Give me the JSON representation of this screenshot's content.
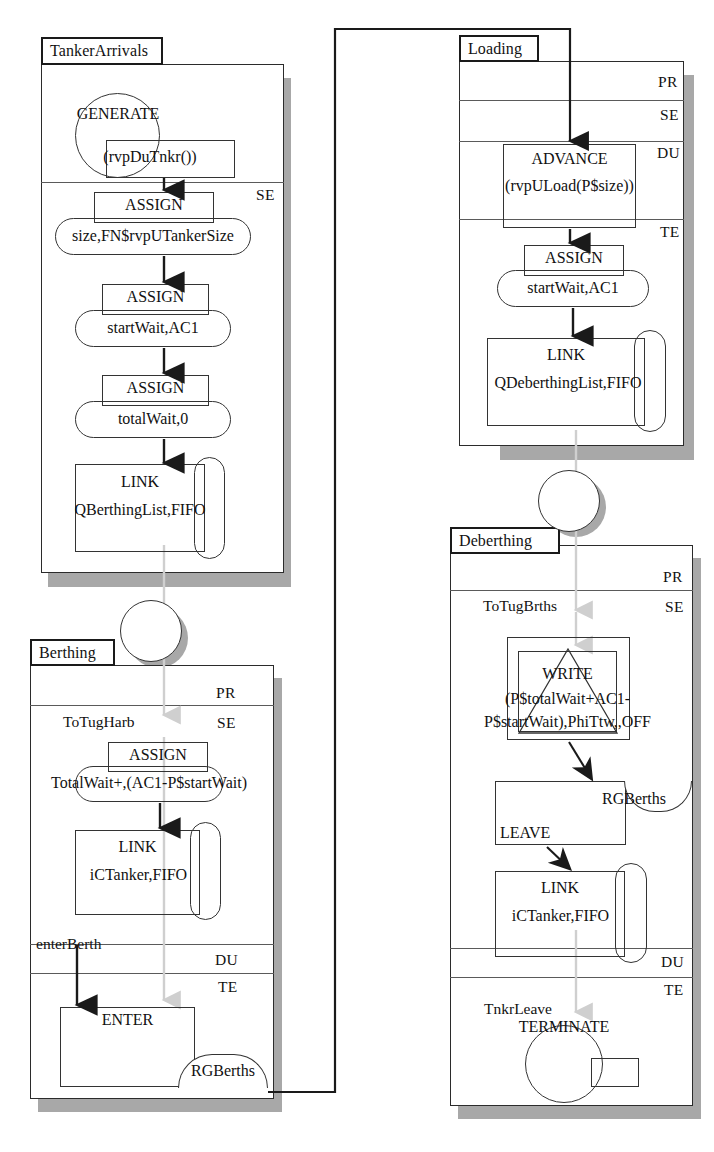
{
  "diagram": {
    "zone_labels": {
      "pr": "PR",
      "se": "SE",
      "du": "DU",
      "te": "TE"
    }
  },
  "blocks": {
    "tanker_arrivals": {
      "name": "TankerArrivals",
      "zone_se": "SE",
      "generate": {
        "op": "GENERATE",
        "arg": "(rvpDuTnkr())"
      },
      "assign1": {
        "op": "ASSIGN",
        "arg": "size,FN$rvpUTankerSize"
      },
      "assign2": {
        "op": "ASSIGN",
        "arg": "startWait,AC1"
      },
      "assign3": {
        "op": "ASSIGN",
        "arg": "totalWait,0"
      },
      "link": {
        "op": "LINK",
        "arg": "QBerthingList,FIFO"
      }
    },
    "berthing": {
      "name": "Berthing",
      "zone_pr": "PR",
      "zone_se": "SE",
      "zone_du": "DU",
      "zone_te": "TE",
      "entry_label": "ToTugHarb",
      "assign1": {
        "op": "ASSIGN",
        "arg": "TotalWait+,(AC1-P$startWait)"
      },
      "link": {
        "op": "LINK",
        "arg": "iCTanker,FIFO"
      },
      "enter_label": "enterBerth",
      "enter": {
        "op": "ENTER",
        "arg": "RGBerths"
      }
    },
    "loading": {
      "name": "Loading",
      "zone_pr": "PR",
      "zone_se": "SE",
      "zone_du": "DU",
      "zone_te": "TE",
      "advance": {
        "op": "ADVANCE",
        "arg": "(rvpULoad(P$size))"
      },
      "assign1": {
        "op": "ASSIGN",
        "arg": "startWait,AC1"
      },
      "link": {
        "op": "LINK",
        "arg": "QDeberthingList,FIFO"
      }
    },
    "deberthing": {
      "name": "Deberthing",
      "zone_pr": "PR",
      "zone_se": "SE",
      "zone_du": "DU",
      "zone_te": "TE",
      "entry_label": "ToTugBrths",
      "write": {
        "op": "WRITE",
        "arg_line1": "(P$totalWait+AC1-",
        "arg_line2": "P$startWait),PhiTtw,,OFF"
      },
      "leave": {
        "op": "LEAVE",
        "arg": "RGBerths"
      },
      "link": {
        "op": "LINK",
        "arg": "iCTanker,FIFO"
      },
      "terminate_label": "TnkrLeave",
      "terminate": {
        "op": "TERMINATE",
        "arg": ""
      }
    }
  },
  "connectors": {
    "tanker_to_berthing": "transfer",
    "loading_to_deberthing": "transfer",
    "berthing_to_loading": "routing-line"
  },
  "colors": {
    "stroke": "#333333",
    "panel_border": "#2b2b2b",
    "shadow": "#a8a8a8",
    "faint_link": "#cfcfcf",
    "background": "#ffffff"
  }
}
